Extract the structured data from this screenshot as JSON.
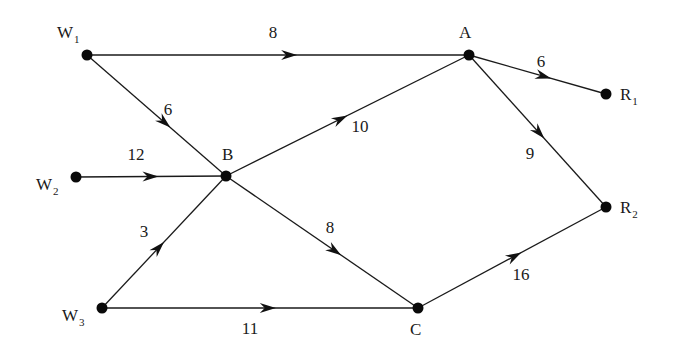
{
  "diagram": {
    "type": "directed-network",
    "nodes": [
      {
        "id": "W1",
        "label": "W",
        "sub": "1",
        "x": 87,
        "y": 55,
        "lx": 57,
        "ly": 38
      },
      {
        "id": "W2",
        "label": "W",
        "sub": "2",
        "x": 76,
        "y": 177,
        "lx": 36,
        "ly": 190
      },
      {
        "id": "W3",
        "label": "W",
        "sub": "3",
        "x": 102,
        "y": 308,
        "lx": 62,
        "ly": 321
      },
      {
        "id": "B",
        "label": "B",
        "sub": "",
        "x": 226,
        "y": 176,
        "lx": 222,
        "ly": 160
      },
      {
        "id": "A",
        "label": "A",
        "sub": "",
        "x": 469,
        "y": 55,
        "lx": 459,
        "ly": 38
      },
      {
        "id": "C",
        "label": "C",
        "sub": "",
        "x": 418,
        "y": 308,
        "lx": 410,
        "ly": 335
      },
      {
        "id": "R1",
        "label": "R",
        "sub": "1",
        "x": 606,
        "y": 94,
        "lx": 620,
        "ly": 100
      },
      {
        "id": "R2",
        "label": "R",
        "sub": "2",
        "x": 606,
        "y": 207,
        "lx": 620,
        "ly": 213
      }
    ],
    "edges": [
      {
        "from": "W1",
        "to": "A",
        "weight": "8",
        "lx": 273,
        "ly": 38,
        "t": 0.55
      },
      {
        "from": "W1",
        "to": "B",
        "weight": "6",
        "lx": 168,
        "ly": 115,
        "t": 0.6
      },
      {
        "from": "W2",
        "to": "B",
        "weight": "12",
        "lx": 136,
        "ly": 160,
        "t": 0.55
      },
      {
        "from": "W3",
        "to": "B",
        "weight": "3",
        "lx": 144,
        "ly": 237,
        "t": 0.5
      },
      {
        "from": "W3",
        "to": "C",
        "weight": "11",
        "lx": 250,
        "ly": 334,
        "t": 0.55
      },
      {
        "from": "B",
        "to": "A",
        "weight": "10",
        "lx": 360,
        "ly": 132,
        "t": 0.5
      },
      {
        "from": "B",
        "to": "C",
        "weight": "8",
        "lx": 330,
        "ly": 233,
        "t": 0.6
      },
      {
        "from": "A",
        "to": "R1",
        "weight": "6",
        "lx": 541,
        "ly": 67,
        "t": 0.6
      },
      {
        "from": "A",
        "to": "R2",
        "weight": "9",
        "lx": 530,
        "ly": 159,
        "t": 0.55
      },
      {
        "from": "C",
        "to": "R2",
        "weight": "16",
        "lx": 521,
        "ly": 280,
        "t": 0.55
      }
    ]
  }
}
